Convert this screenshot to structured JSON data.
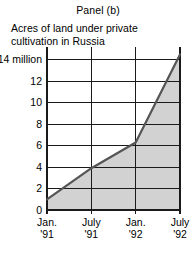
{
  "panel": {
    "title": "Panel (b)",
    "subtitle_line1": "Acres of land under private",
    "subtitle_line2": "cultivation in Russia"
  },
  "colors": {
    "area_fill": "#d2d2d2",
    "line": "#555555",
    "grid": "#1a1a1a",
    "axis": "#1a1a1a",
    "text": "#000000",
    "background": "#ffffff"
  },
  "chart_data": {
    "type": "area",
    "title": "Panel (b)",
    "subtitle": "Acres of land under private cultivation in Russia",
    "xlabel": "",
    "ylabel": "",
    "ylim": [
      0,
      15.2
    ],
    "xlim": [
      0,
      18
    ],
    "grid": true,
    "legend": "none",
    "ytick_values": [
      0,
      2,
      4,
      6,
      8,
      10,
      12,
      14
    ],
    "ytick_labels": [
      "0",
      "2",
      "4",
      "6",
      "8",
      "10",
      "12",
      "14 million"
    ],
    "xtick_values": [
      0,
      6,
      12,
      18
    ],
    "xtick_labels": [
      {
        "line1": "Jan.",
        "line2": "'91"
      },
      {
        "line1": "July",
        "line2": "'91"
      },
      {
        "line1": "Jan.",
        "line2": "'92"
      },
      {
        "line1": "July",
        "line2": "'92"
      }
    ],
    "x": [
      0,
      6,
      12,
      18
    ],
    "values": [
      1.0,
      3.9,
      6.3,
      14.5
    ],
    "series": [
      {
        "name": "Acres of land under private cultivation in Russia",
        "units": "millions of acres",
        "points": [
          {
            "x": 0,
            "label": "Jan. '91",
            "y": 1.0
          },
          {
            "x": 6,
            "label": "July '91",
            "y": 3.9
          },
          {
            "x": 12,
            "label": "Jan. '92",
            "y": 6.3
          },
          {
            "x": 18,
            "label": "July '92",
            "y": 14.5
          }
        ]
      }
    ]
  },
  "geometry": {
    "plot_left": 47,
    "plot_right": 180,
    "plot_top": 47,
    "plot_bottom": 210
  }
}
